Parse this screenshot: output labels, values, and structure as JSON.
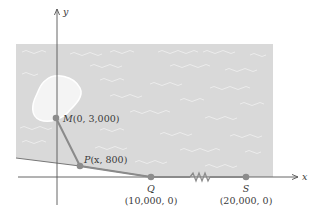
{
  "diagram": {
    "axes": {
      "x_label": "x",
      "y_label": "y"
    },
    "points": {
      "M": {
        "name": "M",
        "coords": "(0, 3,000)"
      },
      "P": {
        "name": "P",
        "coords": "(x, 800)"
      },
      "Q": {
        "name": "Q",
        "coords": "(10,000, 0)"
      },
      "S": {
        "name": "S",
        "coords": "(20,000, 0)"
      }
    },
    "colors": {
      "sea": "#d9d9d9",
      "island": "#f2f2f2",
      "path": "#8a8a8a",
      "point": "#8c8c8c",
      "axis": "#555555"
    }
  }
}
